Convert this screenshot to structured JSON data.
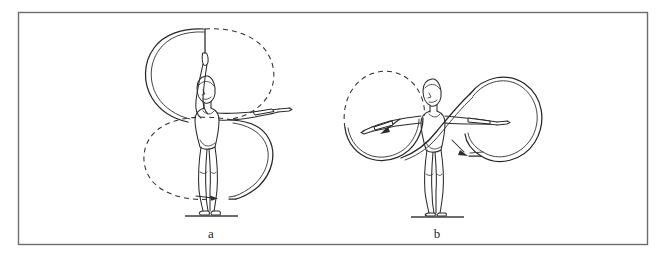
{
  "page": {
    "background_color": "#ffffff",
    "width": 665,
    "height": 258
  },
  "frame": {
    "name": "plate-border",
    "stroke_color": "#6d6d6d",
    "x": 18,
    "y": 12,
    "width": 630,
    "height": 233
  },
  "panels": [
    {
      "id": "a",
      "label": "a",
      "label_x": 211,
      "label_y": 238,
      "description": "Gymnast standing with right arm raised overhead holding ribbon stick, left arm extended forward; ribbon traces a vertical figure-eight of two large loops, upper loop above shoulder level and lower loop around the legs",
      "figure_center_x": 211,
      "ground_y": 215,
      "loops": [
        {
          "name": "upper-loop",
          "style": "dashed-and-solid",
          "cx": 208,
          "cy": 72,
          "rx": 62,
          "ry": 44
        },
        {
          "name": "lower-loop",
          "style": "dashed-and-solid",
          "cx": 205,
          "cy": 158,
          "rx": 62,
          "ry": 45
        }
      ],
      "arrows": [
        {
          "name": "lower-loop-direction-arrow",
          "x": 216,
          "y": 199,
          "direction": "right"
        }
      ]
    },
    {
      "id": "b",
      "label": "b",
      "label_x": 437,
      "label_y": 238,
      "description": "Gymnast standing with both arms extended horizontally to the sides holding ribbon sticks; ribbon traces two large vertical circles, one on each side of the body",
      "figure_center_x": 437,
      "ground_y": 215,
      "loops": [
        {
          "name": "left-circle",
          "style": "dashed-and-solid",
          "cx": 386,
          "cy": 115,
          "rx": 44,
          "ry": 44
        },
        {
          "name": "right-circle",
          "style": "solid",
          "cx": 492,
          "cy": 117,
          "rx": 46,
          "ry": 46
        }
      ],
      "arrows": [
        {
          "name": "left-circle-direction-arrow",
          "x": 388,
          "y": 130,
          "direction": "down-left"
        },
        {
          "name": "right-circle-direction-arrow",
          "x": 466,
          "y": 156,
          "direction": "down-right"
        }
      ]
    }
  ],
  "colors": {
    "ink": "#2b2b2b",
    "frame": "#6d6d6d",
    "background": "#ffffff"
  }
}
